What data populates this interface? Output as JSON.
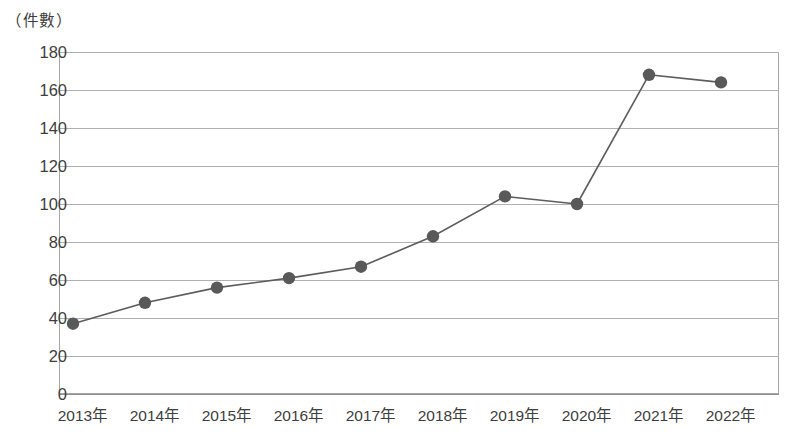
{
  "chart_data": {
    "type": "line",
    "title": "",
    "subtitle": "",
    "xlabel": "",
    "ylabel": "（件數）",
    "categories": [
      "2013年",
      "2014年",
      "2015年",
      "2016年",
      "2017年",
      "2018年",
      "2019年",
      "2020年",
      "2021年",
      "2022年"
    ],
    "values": [
      37,
      48,
      56,
      61,
      67,
      83,
      104,
      100,
      168,
      164
    ],
    "series": [
      {
        "name": "件數",
        "values": [
          37,
          48,
          56,
          61,
          67,
          83,
          104,
          100,
          168,
          164
        ]
      }
    ],
    "ylim": [
      0,
      180
    ],
    "ytick_step": 20,
    "yticks": [
      0,
      20,
      40,
      60,
      80,
      100,
      120,
      140,
      160,
      180
    ],
    "ytick_labels": [
      "0",
      "20",
      "40",
      "60",
      "80",
      "100",
      "120",
      "140",
      "160",
      "180"
    ],
    "grid": true,
    "grid_axis": "y",
    "legend": false,
    "legend_position": "none",
    "marker": "circle",
    "annotations": []
  },
  "style": {
    "line_color": "#5c5c5c",
    "marker_color": "#595959",
    "grid_color": "#b0b0b0",
    "frame_color": "#a6a6a6",
    "text_color": "#3d3d3d",
    "background_color": "#ffffff"
  }
}
